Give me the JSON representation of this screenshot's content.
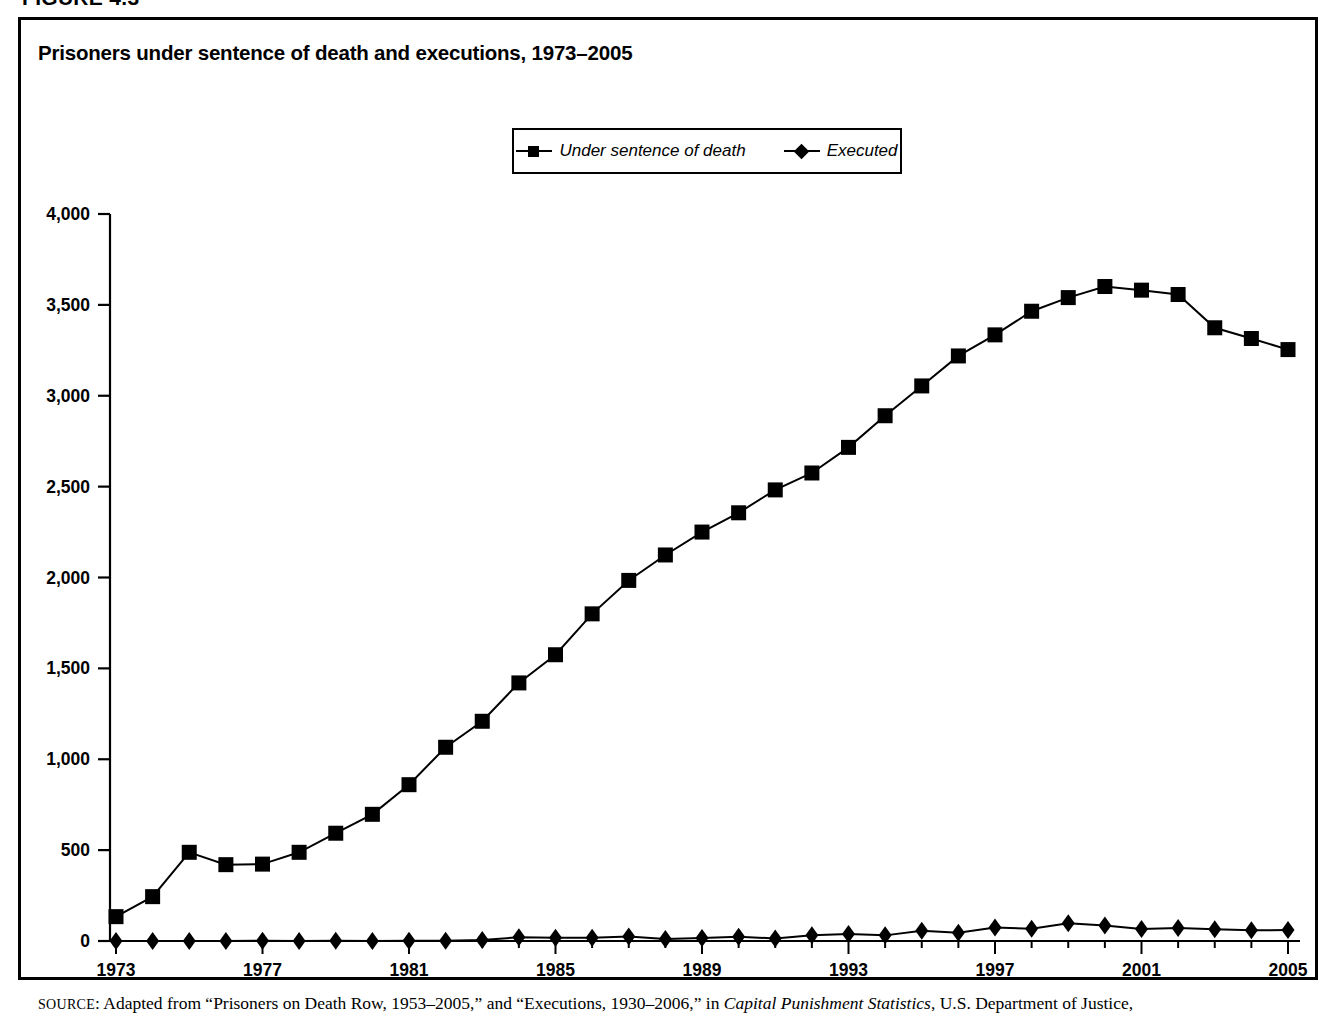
{
  "figure": {
    "label": "FIGURE 4.3",
    "title": "Prisoners under sentence of death and executions, 1973–2005"
  },
  "legend": {
    "items": [
      {
        "label": "Under sentence of death",
        "marker": "square"
      },
      {
        "label": "Executed",
        "marker": "diamond"
      }
    ]
  },
  "source": {
    "prefix": "SOURCE",
    "text_before": ": Adapted from “Prisoners on Death Row, 1953–2005,” and “Executions, 1930–2006,” in ",
    "italic": "Capital Punishment Statistics",
    "text_after": ", U.S. Department of Justice,"
  },
  "axes": {
    "y_ticks": [
      "0",
      "500",
      "1,000",
      "1,500",
      "2,000",
      "2,500",
      "3,000",
      "3,500",
      "4,000"
    ],
    "x_ticks": [
      "1973",
      "1977",
      "1981",
      "1985",
      "1989",
      "1993",
      "1997",
      "2001",
      "2005"
    ]
  },
  "chart_data": {
    "type": "line",
    "title": "Prisoners under sentence of death and executions, 1973–2005",
    "xlabel": "",
    "ylabel": "",
    "xlim": [
      1973,
      2005
    ],
    "ylim": [
      0,
      4000
    ],
    "grid": false,
    "legend_position": "top-center",
    "x": [
      1973,
      1974,
      1975,
      1976,
      1977,
      1978,
      1979,
      1980,
      1981,
      1982,
      1983,
      1984,
      1985,
      1986,
      1987,
      1988,
      1989,
      1990,
      1991,
      1992,
      1993,
      1994,
      1995,
      1996,
      1997,
      1998,
      1999,
      2000,
      2001,
      2002,
      2003,
      2004,
      2005
    ],
    "series": [
      {
        "name": "Under sentence of death",
        "marker": "square",
        "values": [
          134,
          244,
          488,
          420,
          423,
          488,
          593,
          697,
          860,
          1066,
          1209,
          1420,
          1575,
          1800,
          1984,
          2124,
          2250,
          2356,
          2482,
          2575,
          2716,
          2890,
          3054,
          3219,
          3335,
          3465,
          3540,
          3601,
          3581,
          3557,
          3374,
          3315,
          3254
        ]
      },
      {
        "name": "Executed",
        "marker": "diamond",
        "values": [
          0,
          0,
          0,
          0,
          1,
          0,
          2,
          0,
          1,
          2,
          5,
          21,
          18,
          18,
          25,
          11,
          16,
          23,
          14,
          31,
          38,
          31,
          56,
          45,
          74,
          68,
          98,
          85,
          66,
          71,
          65,
          59,
          60
        ]
      }
    ]
  }
}
